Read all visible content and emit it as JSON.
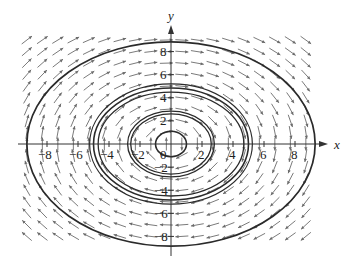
{
  "chart_data": {
    "type": "direction-field",
    "title": "",
    "xlabel": "x",
    "ylabel": "y",
    "xlim": [
      -10,
      10
    ],
    "ylim": [
      -10,
      10
    ],
    "x_ticks": [
      -8,
      -6,
      -4,
      -2,
      0,
      2,
      4,
      6,
      8
    ],
    "y_ticks": [
      -8,
      -6,
      -4,
      -2,
      2,
      4,
      6,
      8
    ],
    "x_tick_labels": [
      "−8",
      "−6",
      "−4",
      "−2",
      "0",
      "2",
      "4",
      "6",
      "8"
    ],
    "y_tick_labels": [
      "−8",
      "−6",
      "−4",
      "−2",
      "2",
      "4",
      "6",
      "8"
    ],
    "origin_label": "0",
    "grid": false,
    "field": {
      "description": "clockwise rotational slope field (dx/dt = y, dy/dt = -x)",
      "x_range": [
        -9.3,
        9.3
      ],
      "y_range": [
        -8.8,
        9.0
      ],
      "x_step": 1.0,
      "y_step": 1.0
    },
    "trajectories": [
      {
        "name": "ellipse-1",
        "rx": 1.0,
        "ry": 1.1,
        "weight": 1.6
      },
      {
        "name": "ellipse-2",
        "rx": 2.6,
        "ry": 2.6,
        "weight": 1.3
      },
      {
        "name": "ellipse-3",
        "rx": 2.8,
        "ry": 2.85,
        "weight": 1.3
      },
      {
        "name": "ellipse-4",
        "rx": 4.7,
        "ry": 4.5,
        "weight": 1.3
      },
      {
        "name": "ellipse-5",
        "rx": 5.0,
        "ry": 4.85,
        "weight": 1.6
      },
      {
        "name": "ellipse-6",
        "rx": 5.25,
        "ry": 5.2,
        "weight": 1.2
      },
      {
        "name": "ellipse-7",
        "rx": 9.3,
        "ry": 8.85,
        "weight": 1.7
      }
    ],
    "colors": {
      "axis": "#333333",
      "field": "#6b6b6b",
      "trajectory": "#2a2a2a"
    }
  }
}
